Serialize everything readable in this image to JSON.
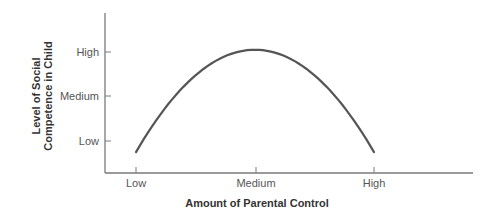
{
  "chart_data": {
    "type": "line",
    "title": "",
    "xlabel": "Amount of Parental Control",
    "ylabel_lines": [
      "Level of Social",
      "Competence in Child"
    ],
    "ylabel": "Level of Social Competence in Child",
    "x_categories": [
      "Low",
      "Medium",
      "High"
    ],
    "y_categories": [
      "Low",
      "Medium",
      "High"
    ],
    "x_numeric": [
      0,
      1,
      2
    ],
    "y_numeric_scale": {
      "Low": 0,
      "Medium": 1,
      "High": 2
    },
    "series": [
      {
        "name": "Social competence vs parental control",
        "shape": "inverted-U (parabolic)",
        "x": [
          0,
          0.25,
          0.5,
          0.75,
          1.0,
          1.25,
          1.5,
          1.75,
          2.0
        ],
        "y": [
          -0.25,
          0.88,
          1.55,
          1.92,
          2.05,
          1.92,
          1.55,
          0.88,
          -0.25
        ]
      }
    ],
    "grid": false,
    "legend": null,
    "colors": {
      "line": "#555555",
      "axis": "#777777",
      "text": "#555555"
    }
  }
}
